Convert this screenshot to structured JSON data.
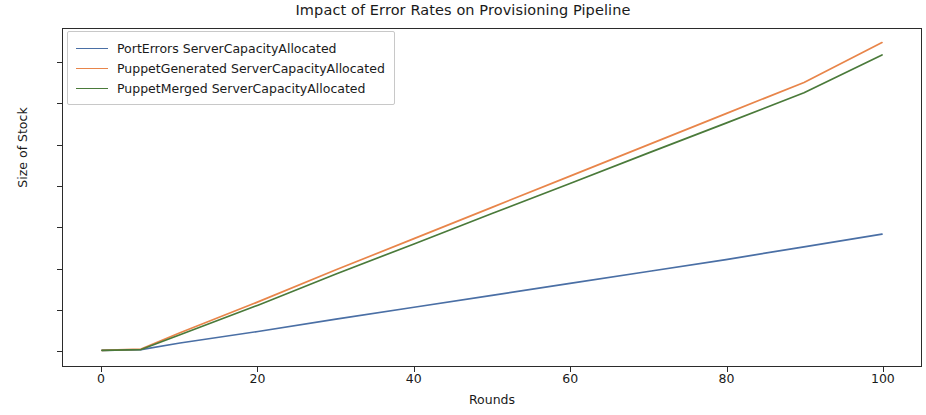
{
  "chart_data": {
    "type": "line",
    "title": "Impact of Error Rates on Provisioning Pipeline",
    "xlabel": "Rounds",
    "ylabel": "Size of Stock",
    "xlim": [
      -5,
      105
    ],
    "ylim": [
      -38,
      782
    ],
    "xticks": [
      0,
      20,
      40,
      60,
      80,
      100
    ],
    "yticks": [
      0,
      100,
      200,
      300,
      400,
      500,
      600,
      700
    ],
    "xtick_labels": [
      "0",
      "20",
      "40",
      "60",
      "80",
      "100"
    ],
    "ytick_labels": [
      "0",
      "100",
      "200",
      "300",
      "400",
      "500",
      "600",
      "700"
    ],
    "grid": false,
    "legend_position": "upper left",
    "x": [
      0,
      5,
      10,
      20,
      30,
      40,
      50,
      60,
      70,
      80,
      90,
      100
    ],
    "series": [
      {
        "name": "PortErrors ServerCapacityAllocated",
        "color": "#4a6fa5",
        "values": [
          0,
          2,
          18,
          46,
          76,
          105,
          134,
          163,
          192,
          221,
          252,
          283
        ]
      },
      {
        "name": "PuppetGenerated ServerCapacityAllocated",
        "color": "#e8854a",
        "values": [
          0,
          3,
          43,
          118,
          196,
          272,
          348,
          424,
          500,
          576,
          652,
          749
        ]
      },
      {
        "name": "PuppetMerged ServerCapacityAllocated",
        "color": "#4a7a3a",
        "values": [
          0,
          2,
          38,
          110,
          186,
          259,
          333,
          406,
          480,
          553,
          627,
          719
        ]
      }
    ]
  },
  "legend": {
    "entries": [
      "PortErrors ServerCapacityAllocated",
      "PuppetGenerated ServerCapacityAllocated",
      "PuppetMerged ServerCapacityAllocated"
    ]
  }
}
